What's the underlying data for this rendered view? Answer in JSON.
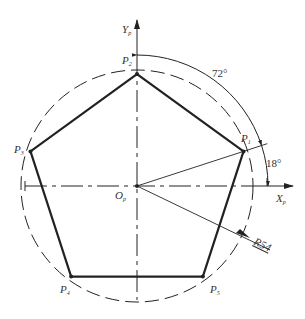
{
  "diagram": {
    "type": "regular-pentagon-construction",
    "colors": {
      "stroke": "#222222",
      "text": "#333333",
      "background": "#ffffff"
    },
    "axes": {
      "x": {
        "label": "X",
        "subscript": "p"
      },
      "y": {
        "label": "Y",
        "subscript": "p"
      }
    },
    "origin": {
      "label": "O",
      "subscript": "p"
    },
    "vertices": [
      {
        "label": "P",
        "subscript": "1",
        "angle_deg": 18
      },
      {
        "label": "P",
        "subscript": "2",
        "angle_deg": 90
      },
      {
        "label": "P",
        "subscript": "3",
        "angle_deg": 162
      },
      {
        "label": "P",
        "subscript": "4",
        "angle_deg": 234
      },
      {
        "label": "P",
        "subscript": "5",
        "angle_deg": 306
      }
    ],
    "angles": {
      "between_vertices": "72°",
      "first_vertex_from_x": "18°"
    },
    "radius_label": "R54",
    "radius_value": 54
  }
}
